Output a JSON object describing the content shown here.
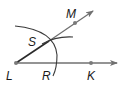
{
  "diagram": {
    "colors": {
      "ray": "#707070",
      "arc": "#3a3a3a",
      "point": "#7a7a7a",
      "label": "#1a1a1a"
    },
    "labels": {
      "L": "L",
      "R": "R",
      "K": "K",
      "S": "S",
      "M": "M"
    },
    "points": {
      "L": [
        16,
        63
      ],
      "K": [
        91,
        63
      ],
      "M": [
        75,
        23
      ],
      "S": [
        49,
        41
      ],
      "R": [
        55,
        63
      ]
    },
    "rays": [
      {
        "name": "ray-LK",
        "from": "L",
        "through": "K"
      },
      {
        "name": "ray-LM",
        "from": "L",
        "through": "M"
      }
    ],
    "arcs": [
      {
        "name": "compass-arc-center-L",
        "center": "L",
        "through": [
          "R",
          "S"
        ]
      },
      {
        "name": "compass-arc-center-R",
        "center": "R",
        "through": [
          "S"
        ]
      }
    ]
  }
}
